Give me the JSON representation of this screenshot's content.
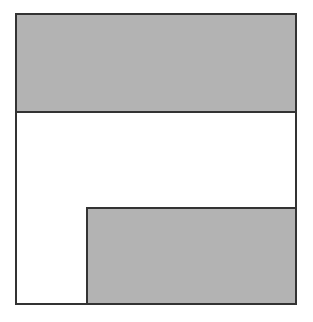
{
  "diagram": {
    "colors": {
      "fill_shaded": "#b3b3b3",
      "fill_blank": "#ffffff",
      "stroke": "#333333"
    },
    "shapes": [
      {
        "id": "outer",
        "label": "",
        "fill": "white",
        "x": 15,
        "y": 13,
        "w": 282,
        "h": 292
      },
      {
        "id": "top-band",
        "label": "",
        "fill": "gray",
        "x": 15,
        "y": 13,
        "w": 282,
        "h": 100
      },
      {
        "id": "bottom-rect",
        "label": "",
        "fill": "gray",
        "x": 86,
        "y": 207,
        "w": 211,
        "h": 98
      }
    ]
  }
}
